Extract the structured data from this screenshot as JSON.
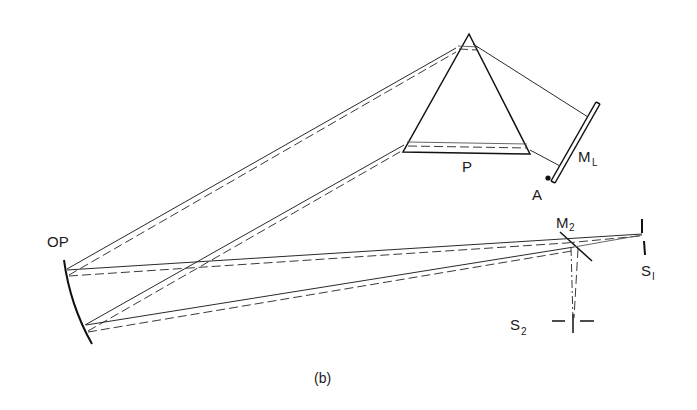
{
  "figure": {
    "caption": "(b)"
  },
  "labels": {
    "op": "OP",
    "prism": "P",
    "littrow_mirror_main": "M",
    "littrow_mirror_sub": "L",
    "pivot_point": "A",
    "mirror2_main": "M",
    "mirror2_sub": "2",
    "slit1_main": "S",
    "slit1_sub": "I",
    "slit2_main": "S",
    "slit2_sub": "2"
  },
  "components": [
    {
      "id": "OP",
      "name": "off-axis paraboloid mirror"
    },
    {
      "id": "P",
      "name": "prism"
    },
    {
      "id": "ML",
      "name": "Littrow mirror"
    },
    {
      "id": "A",
      "name": "mirror pivot"
    },
    {
      "id": "M2",
      "name": "plane mirror"
    },
    {
      "id": "S1",
      "name": "entrance slit"
    },
    {
      "id": "S2",
      "name": "exit slit"
    }
  ],
  "colors": {
    "ink": "#1a1a1a",
    "background": "#ffffff"
  }
}
